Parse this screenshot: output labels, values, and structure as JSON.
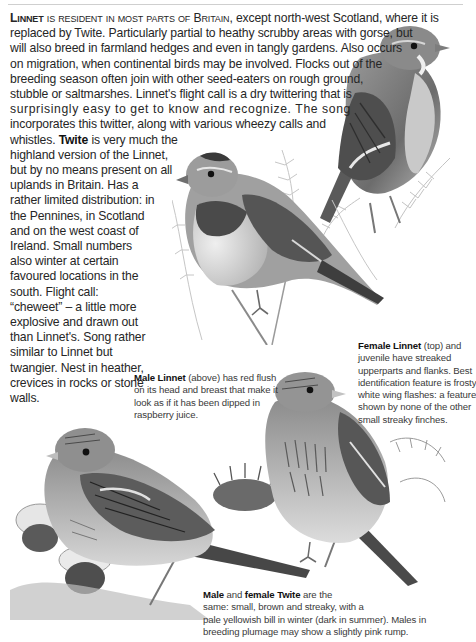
{
  "page": {
    "intro": {
      "lead_word": "Linnet",
      "lead_smallcaps": "is resident in most parts of",
      "lead_britain": "Britain,",
      "line1_rest": "except north-west Scotland, where it is",
      "lines": [
        "replaced by Twite. Particularly partial to heathy scrubby areas with gorse, but",
        "will also breed in farmland hedges and even in tangly gardens. Also occurs",
        "on migration, when continental birds may be involved. Flocks out of the",
        "breeding season often join with other seed-eaters on rough ground,",
        "stubble or saltmarshes. Linnet's flight call is a dry twittering that is",
        "surprisingly easy to get to know and recognize. The song",
        "incorporates this twitter, along with various wheezy calls and"
      ]
    },
    "twite_text": {
      "line_pre": "whistles.",
      "bold_word": "Twite",
      "line_post": "is very much the",
      "lines": [
        "highland version of the Linnet,",
        "but by no means present on all",
        "uplands in Britain. Has a",
        "rather limited distribution: in",
        "the Pennines, in Scotland",
        "and on the west coast of",
        "Ireland. Small numbers",
        "also winter at certain",
        "favoured locations in the",
        "south. Flight call:",
        "“cheweet” – a little more",
        "explosive and drawn out",
        "than Linnet's. Song rather",
        "similar to Linnet but",
        "twangier. Nest in heather,",
        "crevices in rocks or stone",
        "walls."
      ]
    },
    "captions": {
      "female_linnet": {
        "bold": "Female Linnet",
        "rest_first": " (top) and",
        "lines": [
          "juvenile have streaked",
          "upperparts and flanks. Best",
          "identification feature is frosty",
          "white wing flashes: a feature",
          "shown by none of the other",
          "small streaky finches."
        ]
      },
      "male_linnet": {
        "bold": "Male Linnet",
        "rest_first": " (above) has red flush",
        "lines": [
          "on its head and breast that make it",
          "look as if it has been dipped in",
          "raspberry juice."
        ]
      },
      "twite_pair": {
        "bold1": "Male",
        "mid": " and ",
        "bold2": "female Twite",
        "rest_first": " are the",
        "lines": [
          "same: small, brown and streaky, with a",
          "pale yellowish bill in winter (dark in summer). Males in",
          "breeding plumage may show a slightly pink rump."
        ]
      }
    },
    "illustrations": [
      {
        "id": "female-linnet",
        "label": "Female Linnet illustration"
      },
      {
        "id": "male-linnet",
        "label": "Male Linnet illustration"
      },
      {
        "id": "twite-left",
        "label": "Twite illustration (left)"
      },
      {
        "id": "twite-right",
        "label": "Twite illustration (right)"
      }
    ]
  }
}
